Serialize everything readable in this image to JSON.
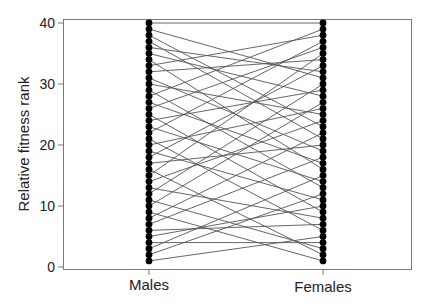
{
  "chart_data": {
    "type": "line",
    "subtype": "bipartite-rank-plot",
    "title": "",
    "xlabel": "",
    "ylabel": "Relative fitness rank",
    "categories": [
      "Males",
      "Females"
    ],
    "yticks": [
      0,
      10,
      20,
      30,
      40
    ],
    "ylim": [
      0,
      40
    ],
    "grid": false,
    "legend": null,
    "n_individuals": 40,
    "male_ranks": [
      1,
      2,
      3,
      4,
      5,
      6,
      7,
      8,
      9,
      10,
      11,
      12,
      13,
      14,
      15,
      16,
      17,
      18,
      19,
      20,
      21,
      22,
      23,
      24,
      25,
      26,
      27,
      28,
      29,
      30,
      31,
      32,
      33,
      34,
      35,
      36,
      37,
      38,
      39,
      40
    ],
    "pairs": [
      [
        1,
        5
      ],
      [
        2,
        12
      ],
      [
        3,
        15
      ],
      [
        4,
        4
      ],
      [
        5,
        10
      ],
      [
        6,
        7
      ],
      [
        7,
        18
      ],
      [
        8,
        22
      ],
      [
        9,
        1
      ],
      [
        10,
        27
      ],
      [
        11,
        3
      ],
      [
        12,
        30
      ],
      [
        13,
        8
      ],
      [
        14,
        24
      ],
      [
        15,
        35
      ],
      [
        16,
        2
      ],
      [
        17,
        20
      ],
      [
        18,
        33
      ],
      [
        19,
        11
      ],
      [
        20,
        26
      ],
      [
        21,
        6
      ],
      [
        22,
        37
      ],
      [
        23,
        14
      ],
      [
        24,
        29
      ],
      [
        25,
        9
      ],
      [
        26,
        36
      ],
      [
        27,
        17
      ],
      [
        28,
        39
      ],
      [
        29,
        13
      ],
      [
        30,
        25
      ],
      [
        31,
        19
      ],
      [
        32,
        34
      ],
      [
        33,
        38
      ],
      [
        34,
        16
      ],
      [
        35,
        28
      ],
      [
        36,
        32
      ],
      [
        37,
        21
      ],
      [
        38,
        23
      ],
      [
        39,
        31
      ],
      [
        40,
        40
      ]
    ]
  },
  "axis": {
    "ylabel": "Relative fitness rank",
    "yticks": [
      "0",
      "10",
      "20",
      "30",
      "40"
    ],
    "categories": [
      "Males",
      "Females"
    ]
  }
}
